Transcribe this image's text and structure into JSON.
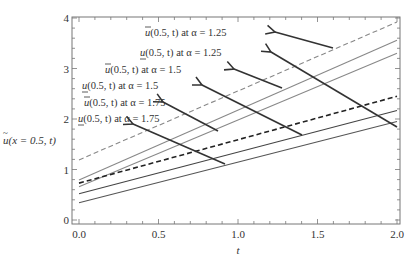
{
  "chart_data": {
    "type": "line",
    "title": "",
    "xlabel": "t",
    "ylabel": "ũ(x = 0.5, t)",
    "xlim": [
      0.0,
      2.0
    ],
    "ylim": [
      0,
      4
    ],
    "x_ticks": [
      "0.0",
      "0.5",
      "1.0",
      "1.5",
      "2.0"
    ],
    "y_ticks": [
      "0",
      "1",
      "2",
      "3",
      "4"
    ],
    "grid": false,
    "legend": "annotations with arrows",
    "x": [
      0.0,
      2.0
    ],
    "series": [
      {
        "name": "ū(0.5, t) at α = 1.25",
        "values": [
          1.19,
          3.92
        ],
        "color": "#888888",
        "style": "dashed"
      },
      {
        "name": "u̲(0.5, t) at α = 1.25",
        "values": [
          0.79,
          3.56
        ],
        "color": "#888888",
        "style": "solid"
      },
      {
        "name": "ū(0.5, t) at α = 1.5",
        "values": [
          0.66,
          3.3
        ],
        "color": "#888888",
        "style": "solid"
      },
      {
        "name": "u̲(0.5, t) at α = 1.5",
        "values": [
          0.73,
          2.45
        ],
        "color": "#222222",
        "style": "dashed"
      },
      {
        "name": "ū(0.5, t) at α = 1.75",
        "values": [
          0.52,
          2.17
        ],
        "color": "#444444",
        "style": "solid"
      },
      {
        "name": "u̲(0.5, t) at α = 1.75",
        "values": [
          0.34,
          1.95
        ],
        "color": "#555555",
        "style": "solid"
      }
    ],
    "annotations": [
      {
        "text": "ū(0.5, t) at α = 1.25",
        "label_x": 145,
        "label_y": 36,
        "arrow": [
          [
            333,
            48
          ],
          [
            275,
            32
          ]
        ]
      },
      {
        "text": "u̲(0.5, t) at α = 1.25",
        "label_x": 140,
        "label_y": 56,
        "arrow": [
          [
            397,
            127
          ],
          [
            271,
            52
          ]
        ]
      },
      {
        "text": "ū(0.5, t) at α = 1.5",
        "label_x": 105,
        "label_y": 73,
        "arrow": [
          [
            282,
            88
          ],
          [
            234,
            69
          ]
        ]
      },
      {
        "text": "u̲(0.5, t) at α = 1.5",
        "label_x": 82,
        "label_y": 89,
        "arrow": [
          [
            302,
            135
          ],
          [
            202,
            85
          ]
        ]
      },
      {
        "text": "ū(0.5, t) at α = 1.75",
        "label_x": 84,
        "label_y": 106,
        "arrow": [
          [
            218,
            131
          ],
          [
            163,
            102
          ]
        ]
      },
      {
        "text": "u̲(0.5, t) at α = 1.75",
        "label_x": 78,
        "label_y": 122,
        "arrow": [
          [
            225,
            164
          ],
          [
            133,
            124
          ]
        ]
      }
    ]
  },
  "axes": {
    "xlabel": "t",
    "ylabel_main": "ũ",
    "ylabel_args": "(x = 0.5, t)",
    "x_ticks": [
      "0.0",
      "0.5",
      "1.0",
      "1.5",
      "2.0"
    ],
    "y_ticks": [
      "0",
      "1",
      "2",
      "3",
      "4"
    ]
  },
  "labels": {
    "a125_upper": {
      "sym": "u",
      "mark": "over",
      "rest": "(0.5, t) at α = 1.25"
    },
    "a125_lower": {
      "sym": "u",
      "mark": "under",
      "rest": "(0.5, t) at α = 1.25"
    },
    "a15_upper": {
      "sym": "u",
      "mark": "over",
      "rest": "(0.5, t) at α = 1.5"
    },
    "a15_lower": {
      "sym": "u",
      "mark": "under",
      "rest": "(0.5, t) at α = 1.5"
    },
    "a175_upper": {
      "sym": "u",
      "mark": "over",
      "rest": "(0.5, t) at α = 1.75"
    },
    "a175_lower": {
      "sym": "u",
      "mark": "under",
      "rest": "(0.5, t) at α = 1.75"
    }
  }
}
